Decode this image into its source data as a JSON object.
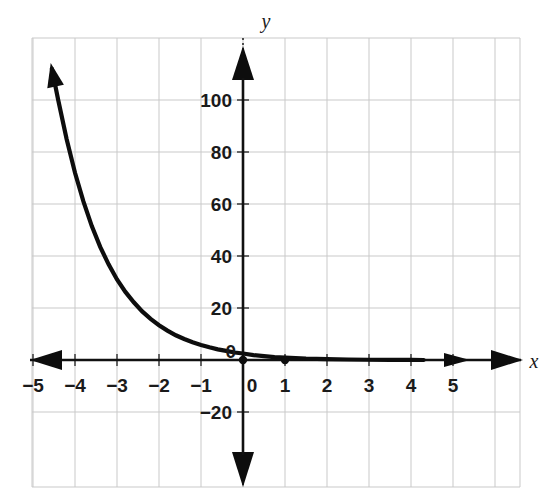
{
  "chart_data": {
    "type": "line",
    "title": "",
    "subtitle": "",
    "xlabel": "x",
    "ylabel": "y",
    "xlim": [
      -5.5,
      6.5
    ],
    "ylim": [
      -30,
      115
    ],
    "grid": true,
    "legend": null,
    "legend_position": "none",
    "x_ticks": [
      -5,
      -4,
      -3,
      -2,
      -1,
      0,
      1,
      2,
      3,
      4,
      5
    ],
    "x_tick_labels": [
      "−5",
      "−4",
      "−3",
      "−2",
      "−1",
      "0",
      "1",
      "2",
      "3",
      "4",
      "5"
    ],
    "y_ticks": [
      -20,
      0,
      20,
      40,
      60,
      80,
      100
    ],
    "y_tick_labels": [
      "−20",
      "0",
      "20",
      "40",
      "60",
      "80",
      "100"
    ],
    "series": [
      {
        "name": "exponential decay",
        "description": "decreasing exponential curve approaching y=0 asymptotically as x increases, rising steeply for negative x",
        "x": [
          -4.55,
          -4.4,
          -4.2,
          -4.0,
          -3.8,
          -3.6,
          -3.4,
          -3.2,
          -3.0,
          -2.8,
          -2.6,
          -2.4,
          -2.2,
          -2.0,
          -1.8,
          -1.6,
          -1.4,
          -1.2,
          -1.0,
          -0.8,
          -0.6,
          -0.4,
          -0.2,
          0.0,
          0.25,
          0.5,
          0.75,
          1.0,
          1.5,
          2.0,
          2.5,
          3.0,
          3.5,
          4.0,
          4.3
        ],
        "y": [
          112.0,
          100.0,
          85.0,
          72.0,
          61.0,
          51.5,
          43.5,
          36.8,
          31.0,
          26.2,
          22.2,
          18.7,
          15.8,
          13.4,
          11.3,
          9.5,
          8.1,
          6.8,
          5.8,
          4.9,
          4.1,
          3.5,
          2.9,
          2.5,
          1.9,
          1.5,
          1.1,
          0.9,
          0.5,
          0.3,
          0.2,
          0.1,
          0.05,
          0.02,
          0.0
        ]
      }
    ],
    "marked_points": [
      {
        "label": "origin-point",
        "x": 0,
        "y": 0
      },
      {
        "label": "point-at-x-1",
        "x": 1,
        "y": 0
      }
    ],
    "annotations": [
      {
        "name": "curve-arrow-upper-left",
        "description": "arrowhead on curve at upper left indicating continuation"
      },
      {
        "name": "x-axis-arrow-left",
        "description": "arrowhead at left end of x-axis"
      },
      {
        "name": "x-axis-arrow-right",
        "description": "arrowhead at right end of x-axis"
      },
      {
        "name": "x-axis-inner-arrow-right",
        "description": "secondary arrowhead on x-axis near x=4.3"
      },
      {
        "name": "y-axis-arrow-top",
        "description": "arrowhead at top of y-axis"
      },
      {
        "name": "y-axis-arrow-bottom",
        "description": "arrowhead at bottom of y-axis"
      }
    ],
    "colors": {
      "curve": "#0d0d0d",
      "axis": "#111111",
      "grid": "#c9c9c9",
      "text": "#1a1a1a",
      "background": "#ffffff"
    }
  },
  "axis_labels": {
    "x": "x",
    "y": "y"
  }
}
